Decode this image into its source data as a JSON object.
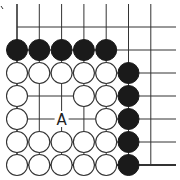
{
  "board": {
    "type": "go-problem-diagram",
    "columns": 7,
    "rows": 7,
    "origin_x": 17,
    "origin_y": 27,
    "spacing_x": 22.3,
    "spacing_y": 23,
    "stone_radius": 10.5,
    "colors": {
      "line": "#333333",
      "black_stone": "#1a1a1a",
      "white_stone_fill": "#ffffff",
      "white_stone_stroke": "#333333"
    },
    "edges": {
      "left_line_from_row": 0,
      "bottom_edge_row": 6
    },
    "stones": {
      "black": [
        [
          0,
          1
        ],
        [
          1,
          1
        ],
        [
          2,
          1
        ],
        [
          3,
          1
        ],
        [
          4,
          1
        ],
        [
          5,
          2
        ],
        [
          5,
          3
        ],
        [
          5,
          4
        ],
        [
          5,
          5
        ],
        [
          5,
          6
        ]
      ],
      "white": [
        [
          0,
          2
        ],
        [
          1,
          2
        ],
        [
          2,
          2
        ],
        [
          3,
          2
        ],
        [
          4,
          2
        ],
        [
          0,
          3
        ],
        [
          3,
          3
        ],
        [
          4,
          3
        ],
        [
          0,
          4
        ],
        [
          4,
          4
        ],
        [
          0,
          5
        ],
        [
          1,
          5
        ],
        [
          2,
          5
        ],
        [
          3,
          5
        ],
        [
          4,
          5
        ],
        [
          0,
          6
        ],
        [
          1,
          6
        ],
        [
          2,
          6
        ],
        [
          3,
          6
        ],
        [
          4,
          6
        ]
      ]
    },
    "labels": [
      {
        "col": 2,
        "row": 4,
        "text": "A"
      }
    ]
  }
}
